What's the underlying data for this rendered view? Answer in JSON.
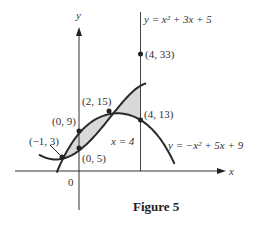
{
  "figure": {
    "caption": "Figure 5"
  },
  "chart_data": {
    "type": "line",
    "title": "Figure 5",
    "xlabel": "x",
    "ylabel": "y",
    "origin_label": "0",
    "grid": false,
    "series": [
      {
        "name": "y = x² + 3x + 5",
        "label": "y = x² + 3x + 5",
        "function": "x^2 + 3x + 5",
        "x": [
          -2.7,
          -2,
          -1,
          0,
          1,
          2,
          3,
          4,
          4.3
        ],
        "values": [
          4.19,
          3,
          3,
          5,
          9,
          15,
          23,
          33,
          36.4
        ]
      },
      {
        "name": "y = -x² + 5x + 9",
        "label": "y = −x² + 5x + 9",
        "function": "-x^2 + 5x + 9",
        "x": [
          -1.5,
          -1,
          0,
          1,
          2,
          2.5,
          3,
          4,
          5,
          6.5
        ],
        "values": [
          -0.75,
          3,
          9,
          13,
          15,
          15.25,
          15,
          13,
          9,
          -0.75
        ]
      }
    ],
    "annotations": [
      {
        "point": [
          -1,
          3
        ],
        "label": "(−1, 3)"
      },
      {
        "point": [
          0,
          9
        ],
        "label": "(0, 9)"
      },
      {
        "point": [
          0,
          5
        ],
        "label": "(0, 5)"
      },
      {
        "point": [
          2,
          15
        ],
        "label": "(2, 15)"
      },
      {
        "point": [
          4,
          33
        ],
        "label": "(4, 33)"
      },
      {
        "point": [
          4,
          13
        ],
        "label": "(4, 13)"
      },
      {
        "vertical_line": 4,
        "label": "x = 4"
      }
    ],
    "shaded_regions": [
      {
        "between": [
          "y = x² + 3x + 5",
          "y = -x² + 5x + 9"
        ],
        "x_range": [
          -1,
          2
        ]
      },
      {
        "between": [
          "y = x² + 3x + 5",
          "y = -x² + 5x + 9"
        ],
        "x_range": [
          2,
          4
        ]
      }
    ]
  },
  "labels": {
    "y_axis": "y",
    "x_axis": "x",
    "origin": "0",
    "upper_curve": "y = x² + 3x + 5",
    "lower_curve": "y = −x² + 5x + 9",
    "vline": "x = 4",
    "p_m1_3": "(−1, 3)",
    "p_0_9": "(0, 9)",
    "p_0_5": "(0, 5)",
    "p_2_15": "(2, 15)",
    "p_4_33": "(4, 33)",
    "p_4_13": "(4, 13)"
  },
  "colors": {
    "curve": "#2a2a2a",
    "axis": "#333333",
    "shade": "#d9d9d9"
  }
}
